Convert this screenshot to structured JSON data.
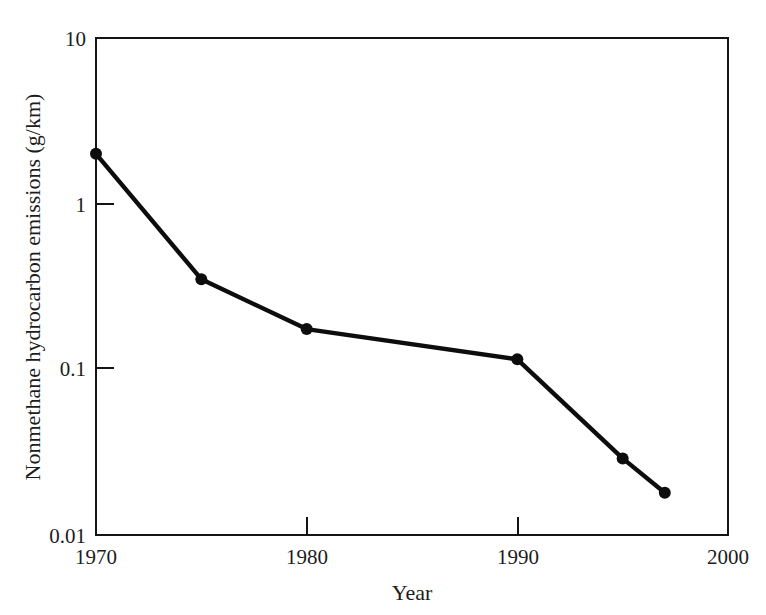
{
  "figure": {
    "background_color": "#ffffff",
    "line_color": "#0d0d0d",
    "axis_color": "#141414"
  },
  "axes": {
    "x_title": "Year",
    "y_title": "Nonmethane hydrocarbon emissions (g/km)",
    "x_ticks": [
      "1970",
      "1980",
      "1990",
      "2000"
    ],
    "y_ticks": [
      "10",
      "1",
      "0.1",
      "0.01"
    ]
  },
  "chart_data": {
    "type": "line",
    "title": "",
    "xlabel": "Year",
    "ylabel": "Nonmethane hydrocarbon emissions (g/km)",
    "xlim": [
      1970,
      2000
    ],
    "ylim": [
      0.01,
      10
    ],
    "yscale": "log",
    "xscale": "linear",
    "grid": false,
    "legend": false,
    "x_tick_values": [
      1970,
      1980,
      1990,
      2000
    ],
    "y_tick_values": [
      10,
      1,
      0.1,
      0.01
    ],
    "x": [
      1970,
      1975,
      1980,
      1990,
      1995,
      1997
    ],
    "values": [
      2.0,
      0.35,
      0.175,
      0.115,
      0.029,
      0.018
    ],
    "series": [
      {
        "name": "Nonmethane hydrocarbon emissions",
        "marker": "filled-circle",
        "points": [
          {
            "x": 1970,
            "y": 2.0
          },
          {
            "x": 1975,
            "y": 0.35
          },
          {
            "x": 1980,
            "y": 0.175
          },
          {
            "x": 1990,
            "y": 0.115
          },
          {
            "x": 1995,
            "y": 0.029
          },
          {
            "x": 1997,
            "y": 0.018
          }
        ]
      }
    ]
  }
}
